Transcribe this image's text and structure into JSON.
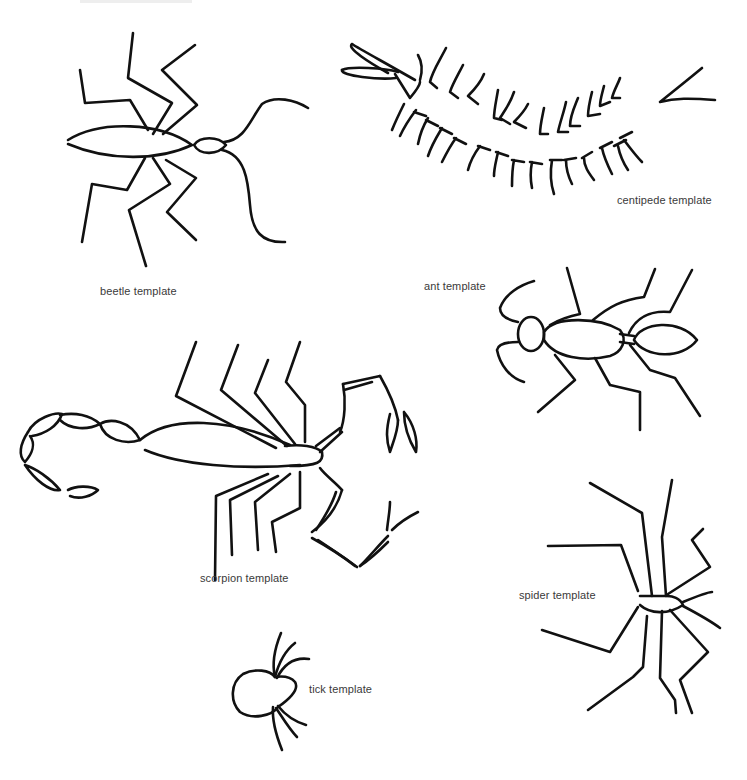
{
  "page": {
    "background": "#ffffff",
    "ink_color": "#111111",
    "label_color": "#3a3a3a"
  },
  "templates": [
    {
      "id": "beetle",
      "label": "beetle template"
    },
    {
      "id": "centipede",
      "label": "centipede template"
    },
    {
      "id": "ant",
      "label": "ant template"
    },
    {
      "id": "scorpion",
      "label": "scorpion template"
    },
    {
      "id": "spider",
      "label": "spider template"
    },
    {
      "id": "tick",
      "label": "tick template"
    }
  ]
}
